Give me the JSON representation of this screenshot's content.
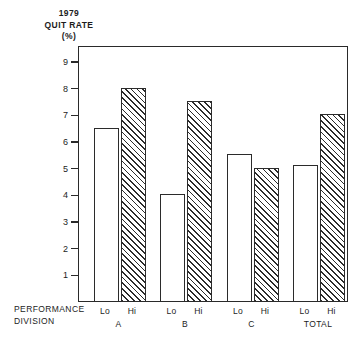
{
  "title": {
    "line1": "1979",
    "line2": "QUIT RATE",
    "line3": "(%)"
  },
  "axis_caption": {
    "line1": "PERFORMANCE",
    "line2": "DIVISION"
  },
  "chart_data": {
    "type": "bar",
    "title": "1979 QUIT RATE (%)",
    "subtitle": "",
    "xlabel": "PERFORMANCE DIVISION",
    "ylabel": "1979 QUIT RATE (%)",
    "ylim": [
      0,
      9.6
    ],
    "yticks": [
      1,
      2,
      3,
      4,
      5,
      6,
      7,
      8,
      9
    ],
    "ytick_labels": [
      "1",
      "2",
      "3",
      "4",
      "5",
      "6",
      "7",
      "8",
      "9"
    ],
    "grid": false,
    "legend": false,
    "legend_position": "none",
    "categories": [
      "A",
      "B",
      "C",
      "TOTAL"
    ],
    "subcategories": [
      "Lo",
      "Hi"
    ],
    "series": [
      {
        "name": "Lo",
        "fill": "open",
        "values": [
          6.5,
          4.0,
          5.5,
          5.1
        ]
      },
      {
        "name": "Hi",
        "fill": "hatched",
        "values": [
          8.0,
          7.5,
          5.0,
          7.0
        ]
      }
    ],
    "bars": [
      {
        "group": "A",
        "sub": "Lo",
        "value": 6.5,
        "fill": "open"
      },
      {
        "group": "A",
        "sub": "Hi",
        "value": 8.0,
        "fill": "hatched"
      },
      {
        "group": "B",
        "sub": "Lo",
        "value": 4.0,
        "fill": "open"
      },
      {
        "group": "B",
        "sub": "Hi",
        "value": 7.5,
        "fill": "hatched"
      },
      {
        "group": "C",
        "sub": "Lo",
        "value": 5.5,
        "fill": "open"
      },
      {
        "group": "C",
        "sub": "Hi",
        "value": 5.0,
        "fill": "hatched"
      },
      {
        "group": "TOTAL",
        "sub": "Lo",
        "value": 5.1,
        "fill": "open"
      },
      {
        "group": "TOTAL",
        "sub": "Hi",
        "value": 7.0,
        "fill": "hatched"
      }
    ]
  },
  "colors": {
    "ink": "#2b2b2b",
    "background": "#ffffff"
  }
}
